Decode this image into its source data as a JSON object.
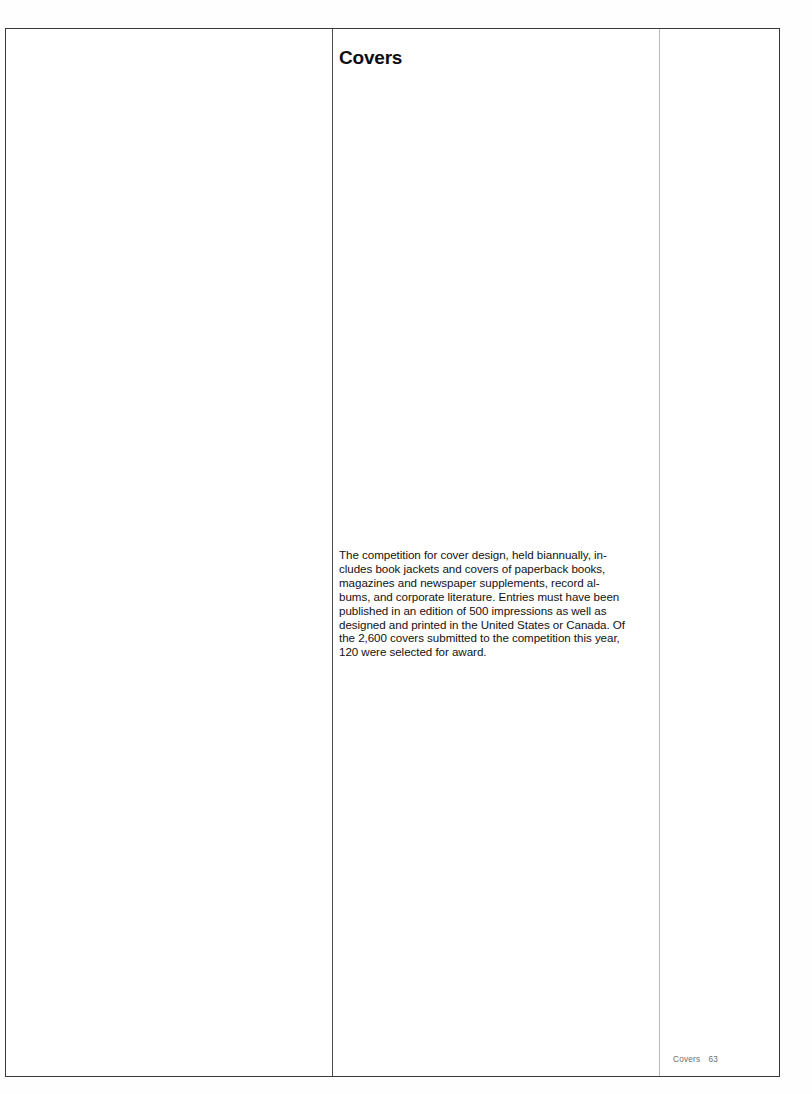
{
  "page": {
    "section_title": "Covers",
    "background_color": "#ffffff",
    "frame_color": "#3a3a3a",
    "main_rule_color": "#4a4a4a",
    "outer_rule_color": "#b9b9b9"
  },
  "body": {
    "paragraph": "The competition for cover design, held biannually, includes book jackets and covers of paperback books, magazines and newspaper supplements, record albums, and corporate literature. Entries must have been published in an edition of 500 impressions as well as designed and printed in the United States or Canada. Of the 2,600 covers submitted to the competition this year, 120 were selected for award.",
    "lines": [
      "The competition for cover design, held biannually, in-",
      "cludes book jackets and covers of paperback books,",
      "magazines and newspaper supplements, record al-",
      "bums, and corporate literature. Entries must have been",
      "published in an edition of 500 impressions as well as",
      "designed and printed in the United States or Canada. Of",
      "the 2,600 covers submitted to the competition this year,",
      "120 were selected for award."
    ]
  },
  "footer": {
    "label": "Covers",
    "page_number": "63",
    "text_color": "#6b6b6b"
  },
  "columns": {
    "plate_label": "",
    "text_label": "",
    "margin_label": ""
  }
}
